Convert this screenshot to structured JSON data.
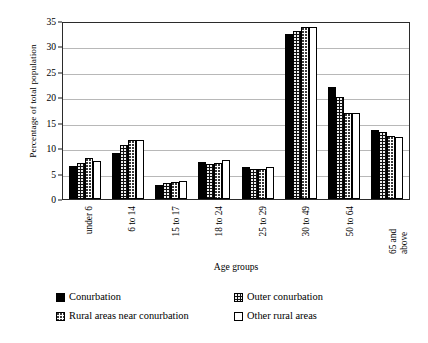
{
  "chart_data": {
    "type": "bar",
    "title": "",
    "xlabel": "Age groups",
    "ylabel": "Percentage of total population",
    "ylim": [
      0,
      35
    ],
    "ytick_step": 5,
    "yticks": [
      0,
      5,
      10,
      15,
      20,
      25,
      30,
      35
    ],
    "grid": true,
    "legend_position": "bottom",
    "categories": [
      "under 6",
      "6 to 14",
      "15 to 17",
      "18 to 24",
      "25 to 29",
      "30 to 49",
      "50 to 64",
      "65 and above"
    ],
    "series": [
      {
        "name": "Conurbation",
        "pattern": "solid-black",
        "values": [
          6.5,
          9.1,
          2.8,
          7.2,
          6.3,
          32.4,
          22.0,
          13.6
        ]
      },
      {
        "name": "Outer conurbation",
        "pattern": "dark-dotted",
        "values": [
          7.0,
          10.6,
          3.2,
          6.8,
          5.9,
          33.0,
          20.0,
          13.2
        ]
      },
      {
        "name": "Rural areas near conurbation",
        "pattern": "light-dotted",
        "values": [
          8.0,
          11.6,
          3.4,
          7.0,
          6.0,
          33.8,
          17.0,
          12.4
        ]
      },
      {
        "name": "Other rural areas",
        "pattern": "white",
        "values": [
          7.5,
          11.6,
          3.5,
          7.7,
          6.2,
          33.8,
          17.0,
          12.2
        ]
      }
    ]
  },
  "legend": {
    "items": [
      {
        "label": "Conurbation",
        "swatch": "solid-black-swatch"
      },
      {
        "label": "Outer conurbation",
        "swatch": "dark-dotted-swatch"
      },
      {
        "label": "Rural areas near conurbation",
        "swatch": "light-dotted-swatch"
      },
      {
        "label": "Other rural areas",
        "swatch": "white-swatch"
      }
    ]
  }
}
